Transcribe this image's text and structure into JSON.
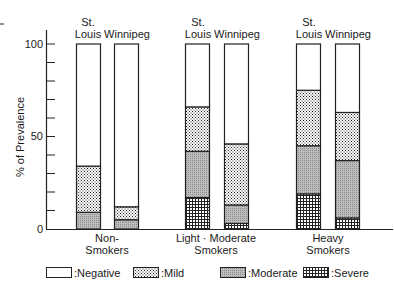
{
  "chart_data": {
    "type": "bar",
    "stacked": true,
    "title": "",
    "xlabel": "",
    "ylabel": "% of Prevalence",
    "ylim": [
      0,
      100
    ],
    "yticks": [
      0,
      50,
      100
    ],
    "minor_tick_step": 10,
    "grid": false,
    "groups": [
      {
        "label_line1": "Non-",
        "label_line2": "Smokers"
      },
      {
        "label_line1": "Light · Moderate",
        "label_line2": "Smokers"
      },
      {
        "label_line1": "Heavy",
        "label_line2": "Smokers"
      }
    ],
    "bar_labels": [
      {
        "line1": "St.",
        "line2": "Louis"
      },
      {
        "line1": "",
        "line2": "Winnipeg"
      }
    ],
    "categories": [
      "Non-Smokers St. Louis",
      "Non-Smokers Winnipeg",
      "Light-Moderate Smokers St. Louis",
      "Light-Moderate Smokers Winnipeg",
      "Heavy Smokers St. Louis",
      "Heavy Smokers Winnipeg"
    ],
    "series": [
      {
        "name": "Severe",
        "values": [
          0,
          0,
          17,
          3,
          19,
          6
        ]
      },
      {
        "name": "Moderate",
        "values": [
          9,
          5,
          25,
          10,
          26,
          31
        ]
      },
      {
        "name": "Mild",
        "values": [
          25,
          7,
          24,
          33,
          30,
          26
        ]
      },
      {
        "name": "Negative",
        "values": [
          66,
          88,
          34,
          54,
          25,
          37
        ]
      }
    ],
    "legend": {
      "position": "bottom",
      "entries": [
        ":Negative",
        ":Mild",
        ":Moderate",
        ":Severe"
      ]
    }
  },
  "labels": {
    "ylabel": "% of Prevalence",
    "y100": "100",
    "y50": "50",
    "y0": "0",
    "st": "St.",
    "louis": "Louis",
    "winnipeg": "Winnipeg",
    "g1a": "Non-",
    "g1b": "Smokers",
    "g2a": "Light · Moderate",
    "g2b": "Smokers",
    "g3a": "Heavy",
    "g3b": "Smokers",
    "leg_neg": ":Negative",
    "leg_mild": ":Mild",
    "leg_mod": ":Moderate",
    "leg_sev": ":Severe"
  }
}
